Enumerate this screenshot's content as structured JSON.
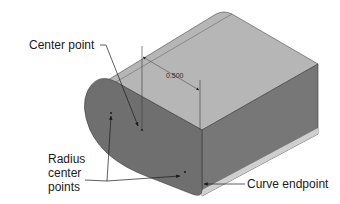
{
  "figure": {
    "colors": {
      "top_face": "#b4b4b4",
      "front_face": "#6e6e6e",
      "side_face": "#7c7c7c",
      "rounded_end": "#727272",
      "edge": "#3a3a3a",
      "highlight": "#d8d8d8",
      "leader": "#1a1a1a"
    }
  },
  "labels": {
    "center_point": "Center point",
    "radius_center_points": [
      "Radius",
      "center",
      "points"
    ],
    "curve_endpoint": "Curve endpoint"
  },
  "dimension": {
    "value": "0.500"
  }
}
